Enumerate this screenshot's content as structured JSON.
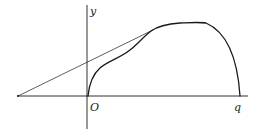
{
  "diagram": {
    "labels": {
      "y_axis": "y",
      "origin": "O",
      "x_intercept": "q"
    },
    "colors": {
      "background": "#ffffff",
      "stroke": "#1a1a1a"
    },
    "elements": [
      {
        "type": "axis",
        "name": "x-axis",
        "from": [
          17,
          96
        ],
        "to": [
          248,
          96
        ]
      },
      {
        "type": "axis",
        "name": "y-axis",
        "from": [
          87,
          5
        ],
        "to": [
          87,
          129
        ]
      },
      {
        "type": "curve",
        "name": "main-curve",
        "from": "origin",
        "to": "q",
        "shape": "rises steeply from O, inflects, flattens near peak, falls steeply to q"
      },
      {
        "type": "line",
        "name": "tangent-line",
        "from": [
          18,
          96
        ],
        "to": [
          151,
          31
        ],
        "note": "line from point on negative x-axis tangent to curve"
      }
    ]
  }
}
